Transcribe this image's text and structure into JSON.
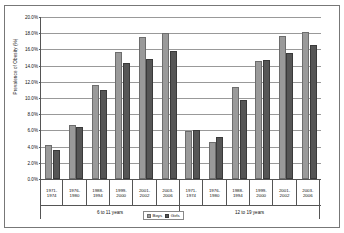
{
  "chart_data": {
    "type": "bar",
    "title": "",
    "xlabel": "",
    "ylabel": "Prevalence of Obesity (%)",
    "ylim": [
      0,
      20
    ],
    "ytick_step": 2,
    "ytick_labels": [
      "0.0%",
      "2.0%",
      "4.0%",
      "6.0%",
      "8.0%",
      "10.0%",
      "12.0%",
      "14.0%",
      "16.0%",
      "18.0%",
      "20.0%"
    ],
    "ytick_values": [
      0,
      2,
      4,
      6,
      8,
      10,
      12,
      14,
      16,
      18,
      20
    ],
    "grid": true,
    "legend_position": "bottom",
    "categories": [
      "1971-1974",
      "1976-1980",
      "1988-1994",
      "1999-2000",
      "2001-2002",
      "2003-2006",
      "1971-1974",
      "1976-1980",
      "1988-1994",
      "1999-2000",
      "2001-2002",
      "2003-2006"
    ],
    "category_lines": [
      [
        "1971-",
        "1974"
      ],
      [
        "1976-",
        "1980"
      ],
      [
        "1988-",
        "1994"
      ],
      [
        "1999-",
        "2000"
      ],
      [
        "2001-",
        "2002"
      ],
      [
        "2003-",
        "2006"
      ],
      [
        "1971-",
        "1974"
      ],
      [
        "1976-",
        "1980"
      ],
      [
        "1988-",
        "1994"
      ],
      [
        "1999-",
        "2000"
      ],
      [
        "2001-",
        "2002"
      ],
      [
        "2003-",
        "2006"
      ]
    ],
    "groups": [
      {
        "label": "6 to 11 years",
        "start": 0,
        "count": 6
      },
      {
        "label": "12 to 19 years",
        "start": 6,
        "count": 6
      }
    ],
    "series": [
      {
        "name": "Boys",
        "color": "#9a9a9a",
        "values": [
          4.2,
          6.7,
          11.6,
          15.7,
          17.5,
          18.0,
          5.9,
          4.6,
          11.3,
          14.6,
          17.6,
          18.2
        ]
      },
      {
        "name": "Girls",
        "color": "#565656",
        "values": [
          3.6,
          6.4,
          11.0,
          14.3,
          14.8,
          15.8,
          6.1,
          5.2,
          9.7,
          14.7,
          15.5,
          16.6
        ]
      }
    ]
  },
  "legend": {
    "items": [
      {
        "label": "Boys"
      },
      {
        "label": "Girls"
      }
    ]
  }
}
